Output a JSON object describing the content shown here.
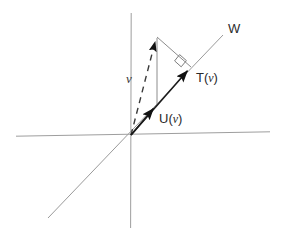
{
  "figure": {
    "background_color": "#ffffff",
    "axis_color": "#9a9a9a",
    "subspace_line_color": "#9a9a9a",
    "vector_color": "#1a1a1a",
    "dashed_color": "#3a3a3a",
    "thin_line_color": "#8c8c8c",
    "labels": {
      "subspace": "W",
      "projection": "T(",
      "projection_arg": "v",
      "projection_close": ")",
      "component": "U(",
      "component_arg": "v",
      "component_close": ")",
      "vector": "v"
    },
    "geometry": {
      "origin": {
        "x": 131,
        "y": 135
      },
      "x_axis": {
        "x1": 16,
        "y1": 136,
        "x2": 270,
        "y2": 132
      },
      "y_axis": {
        "x1": 131,
        "y1": 13,
        "x2": 131,
        "y2": 228
      },
      "w_line": {
        "x1": 48,
        "y1": 218,
        "x2": 223,
        "y2": 35
      },
      "vector_v_tip": {
        "x": 156,
        "y": 38
      },
      "projection_tip": {
        "x": 190,
        "y": 68
      },
      "right_angle_marker": {
        "x": 185,
        "y": 59
      }
    },
    "label_positions": {
      "subspace": {
        "left": 228,
        "top": 22
      },
      "projection": {
        "left": 196,
        "top": 71
      },
      "component": {
        "left": 159,
        "top": 112
      },
      "vector": {
        "left": 126,
        "top": 72
      }
    }
  }
}
